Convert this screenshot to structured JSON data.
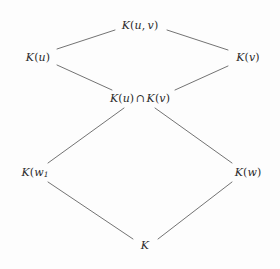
{
  "diagram": {
    "type": "hasse-lattice-diagram",
    "background_color": "#fdfdfd",
    "edge_color": "#5a5a5a",
    "text_color": "#2b2b2b",
    "nodes": [
      {
        "id": "top",
        "label": "K(u, v)",
        "parts": [
          {
            "text": "K",
            "style": "italic"
          },
          {
            "text": "(",
            "style": "roman"
          },
          {
            "text": "u",
            "style": "italic"
          },
          {
            "text": ", ",
            "style": "roman"
          },
          {
            "text": "v",
            "style": "italic"
          },
          {
            "text": ")",
            "style": "roman"
          }
        ],
        "x": 140,
        "y": 25
      },
      {
        "id": "upper-left",
        "label": "K(u)",
        "parts": [
          {
            "text": "K",
            "style": "italic"
          },
          {
            "text": "(",
            "style": "roman"
          },
          {
            "text": "u",
            "style": "italic"
          },
          {
            "text": ")",
            "style": "roman"
          }
        ],
        "x": 38,
        "y": 57
      },
      {
        "id": "upper-right",
        "label": "K(v)",
        "parts": [
          {
            "text": "K",
            "style": "italic"
          },
          {
            "text": "(",
            "style": "roman"
          },
          {
            "text": "v",
            "style": "italic"
          },
          {
            "text": ")",
            "style": "roman"
          }
        ],
        "x": 248,
        "y": 57
      },
      {
        "id": "middle",
        "label": "K(u) ∩ K(v)",
        "parts": [
          {
            "text": "K",
            "style": "italic"
          },
          {
            "text": "(",
            "style": "roman"
          },
          {
            "text": "u",
            "style": "italic"
          },
          {
            "text": ")",
            "style": "roman"
          },
          {
            "text": "∩",
            "style": "operator"
          },
          {
            "text": "K",
            "style": "italic"
          },
          {
            "text": "(",
            "style": "roman"
          },
          {
            "text": "v",
            "style": "italic"
          },
          {
            "text": ")",
            "style": "roman"
          }
        ],
        "x": 140,
        "y": 98
      },
      {
        "id": "lower-left",
        "label": "K(w₁",
        "parts": [
          {
            "text": "K",
            "style": "italic"
          },
          {
            "text": "(",
            "style": "roman"
          },
          {
            "text": "w",
            "style": "italic"
          },
          {
            "text": "1",
            "style": "subscript"
          }
        ],
        "x": 35,
        "y": 172
      },
      {
        "id": "lower-right",
        "label": "K(w)",
        "parts": [
          {
            "text": "K",
            "style": "italic"
          },
          {
            "text": "(",
            "style": "roman"
          },
          {
            "text": "w",
            "style": "italic"
          },
          {
            "text": ")",
            "style": "roman"
          }
        ],
        "x": 248,
        "y": 172
      },
      {
        "id": "bottom",
        "label": "K",
        "parts": [
          {
            "text": "K",
            "style": "italic"
          }
        ],
        "x": 145,
        "y": 245
      }
    ],
    "edges": [
      {
        "id": "edge-upper-left-to-top",
        "from": "upper-left",
        "to": "top",
        "x1": 57,
        "y1": 49,
        "x2": 115,
        "y2": 30
      },
      {
        "id": "edge-top-to-upper-right",
        "from": "top",
        "to": "upper-right",
        "x1": 167,
        "y1": 30,
        "x2": 228,
        "y2": 50
      },
      {
        "id": "edge-upper-left-to-middle",
        "from": "upper-left",
        "to": "middle",
        "x1": 57,
        "y1": 65,
        "x2": 112,
        "y2": 90
      },
      {
        "id": "edge-upper-right-to-middle",
        "from": "upper-right",
        "to": "middle",
        "x1": 228,
        "y1": 66,
        "x2": 175,
        "y2": 90
      },
      {
        "id": "edge-middle-to-lower-left",
        "from": "middle",
        "to": "lower-left",
        "x1": 124,
        "y1": 108,
        "x2": 48,
        "y2": 163
      },
      {
        "id": "edge-middle-to-lower-right",
        "from": "middle",
        "to": "lower-right",
        "x1": 155,
        "y1": 108,
        "x2": 232,
        "y2": 163
      },
      {
        "id": "edge-lower-left-to-bottom",
        "from": "lower-left",
        "to": "bottom",
        "x1": 48,
        "y1": 182,
        "x2": 133,
        "y2": 239
      },
      {
        "id": "edge-bottom-to-lower-right",
        "from": "bottom",
        "to": "lower-right",
        "x1": 158,
        "y1": 239,
        "x2": 232,
        "y2": 182
      }
    ]
  }
}
